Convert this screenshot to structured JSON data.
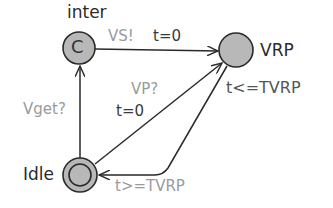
{
  "diagram": {
    "type": "timed-automaton",
    "locations": [
      {
        "id": "inter",
        "name": "inter",
        "committed": true,
        "marker": "C",
        "initial": false
      },
      {
        "id": "VRP",
        "name": "VRP",
        "invariant": "t<=TVRP",
        "initial": false
      },
      {
        "id": "Idle",
        "name": "Idle",
        "initial": true
      }
    ],
    "edges": [
      {
        "from": "inter",
        "to": "VRP",
        "sync": "VS!",
        "update": "t=0"
      },
      {
        "from": "Idle",
        "to": "inter",
        "sync": "Vget?"
      },
      {
        "from": "Idle",
        "to": "VRP",
        "sync": "VP?",
        "update": "t=0"
      },
      {
        "from": "VRP",
        "to": "Idle",
        "guard": "t>=TVRP"
      }
    ]
  },
  "labels": {
    "inter_name": "inter",
    "inter_marker": "C",
    "vrp_name": "VRP",
    "vrp_invariant": "t<=TVRP",
    "idle_name": "Idle",
    "edge_vs_sync": "VS!",
    "edge_vs_update": "t=0",
    "edge_vget_sync": "Vget?",
    "edge_vp_sync": "VP?",
    "edge_vp_update": "t=0",
    "edge_return_guard": "t>=TVRP"
  },
  "colors": {
    "node_fill": "#b8b8b8",
    "stroke": "#2a2a2a",
    "label_dark": "#2a2a2a",
    "label_light": "#9a9a9a"
  }
}
